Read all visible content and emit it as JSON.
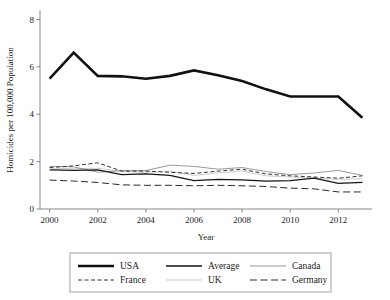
{
  "chart_data": {
    "type": "line",
    "title": "",
    "xlabel": "Year",
    "ylabel": "Homicides per 100,000 Population",
    "x": [
      2000,
      2001,
      2002,
      2003,
      2004,
      2005,
      2006,
      2007,
      2008,
      2009,
      2010,
      2011,
      2012,
      2013
    ],
    "xlim": [
      1999.6,
      2013.4
    ],
    "ylim": [
      0,
      8.4
    ],
    "xticks": [
      2000,
      2002,
      2004,
      2006,
      2008,
      2010,
      2012
    ],
    "xticklabels": [
      "2000",
      "2002",
      "2004",
      "2006",
      "2008",
      "2010",
      "2012"
    ],
    "yticks": [
      0,
      2,
      4,
      6,
      8
    ],
    "yticklabels": [
      "0",
      "2",
      "4",
      "6",
      "8"
    ],
    "grid": false,
    "legend_position": "below",
    "series": [
      {
        "name": "USA",
        "style": "solid",
        "width": 2.6,
        "color": "#111111",
        "dash": "",
        "values": [
          5.5,
          6.6,
          5.62,
          5.6,
          5.5,
          5.62,
          5.85,
          5.65,
          5.4,
          5.05,
          4.75,
          4.75,
          4.75,
          3.85
        ]
      },
      {
        "name": "Average",
        "style": "solid",
        "width": 1.3,
        "color": "#161616",
        "dash": "",
        "values": [
          1.65,
          1.63,
          1.65,
          1.45,
          1.48,
          1.42,
          1.2,
          1.25,
          1.23,
          1.18,
          1.2,
          1.3,
          1.08,
          1.12
        ]
      },
      {
        "name": "Canada",
        "style": "solid",
        "width": 0.6,
        "color": "#555555",
        "dash": "",
        "values": [
          1.8,
          1.78,
          1.55,
          1.62,
          1.62,
          1.85,
          1.8,
          1.68,
          1.75,
          1.58,
          1.45,
          1.52,
          1.63,
          1.42
        ]
      },
      {
        "name": "France",
        "style": "dashed-short",
        "width": 1.0,
        "color": "#333333",
        "dash": "4,2.5",
        "values": [
          1.75,
          1.82,
          1.95,
          1.6,
          1.6,
          1.55,
          1.5,
          1.6,
          1.68,
          1.48,
          1.4,
          1.35,
          1.3,
          1.4
        ]
      },
      {
        "name": "UK",
        "style": "solid-thin",
        "width": 0.5,
        "color": "#9a9a9a",
        "dash": "",
        "values": [
          1.72,
          1.7,
          1.72,
          1.58,
          1.55,
          1.6,
          1.42,
          1.52,
          1.6,
          1.4,
          1.35,
          1.3,
          1.25,
          1.28
        ]
      },
      {
        "name": "Germany",
        "style": "dashed-long",
        "width": 1.0,
        "color": "#2a2a2a",
        "dash": "7,3.5",
        "values": [
          1.22,
          1.18,
          1.12,
          1.02,
          1.0,
          1.0,
          0.98,
          1.0,
          0.98,
          0.95,
          0.88,
          0.85,
          0.72,
          0.72
        ]
      }
    ],
    "legend_entries": [
      {
        "label": "USA",
        "style": "solid",
        "width": 2.6,
        "color": "#111111",
        "dash": ""
      },
      {
        "label": "Average",
        "style": "solid",
        "width": 1.3,
        "color": "#161616",
        "dash": ""
      },
      {
        "label": "Canada",
        "style": "solid",
        "width": 0.6,
        "color": "#555555",
        "dash": ""
      },
      {
        "label": "France",
        "style": "dashed-short",
        "width": 1.0,
        "color": "#333333",
        "dash": "4,2.5"
      },
      {
        "label": "UK",
        "style": "solid-thin",
        "width": 0.5,
        "color": "#9a9a9a",
        "dash": ""
      },
      {
        "label": "Germany",
        "style": "dashed-long",
        "width": 1.0,
        "color": "#2a2a2a",
        "dash": "7,3.5"
      }
    ]
  },
  "layout": {
    "plot": {
      "left": 40,
      "top": 10,
      "right": 372,
      "bottom": 209
    },
    "legend": {
      "left": 70,
      "top": 253,
      "right": 331,
      "bottom": 292
    }
  }
}
